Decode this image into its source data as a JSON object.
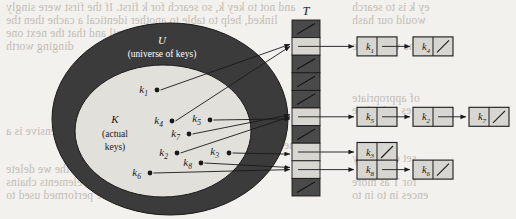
{
  "figure": {
    "table_label": "T",
    "universe_label": "U",
    "universe_sub": "(universe of keys)",
    "actual_label": "K",
    "actual_sub_line1": "(actual",
    "actual_sub_line2": "keys)",
    "colors": {
      "page_background": "#f3f1ed",
      "universe_ring": "#3b3b3b",
      "actual_set_fill": "#e2e0db",
      "slot_dark": "#4a4a4a",
      "slot_light": "#d8d6d1",
      "node_fill": "#d8d6d1",
      "stroke": "#1a1a1a",
      "ring_text": "#ffffff",
      "bleed_text": "#b9b4ac"
    }
  },
  "keys": [
    {
      "id": "k1",
      "label": "k",
      "sub": "1",
      "x": 148,
      "y": 93,
      "dot_x": 157,
      "dot_y": 90
    },
    {
      "id": "k4",
      "label": "k",
      "sub": "4",
      "x": 163,
      "y": 124,
      "dot_x": 172,
      "dot_y": 121
    },
    {
      "id": "k5",
      "label": "k",
      "sub": "5",
      "x": 201,
      "y": 122,
      "dot_x": 210,
      "dot_y": 120
    },
    {
      "id": "k7",
      "label": "k",
      "sub": "7",
      "x": 180,
      "y": 137,
      "dot_x": 189,
      "dot_y": 134
    },
    {
      "id": "k2",
      "label": "k",
      "sub": "2",
      "x": 168,
      "y": 156,
      "dot_x": 177,
      "dot_y": 153
    },
    {
      "id": "k3",
      "label": "k",
      "sub": "3",
      "x": 219,
      "y": 155,
      "dot_x": 229,
      "dot_y": 153
    },
    {
      "id": "k8",
      "label": "k",
      "sub": "8",
      "x": 192,
      "y": 166,
      "dot_x": 201,
      "dot_y": 163
    },
    {
      "id": "k6",
      "label": "k",
      "sub": "6",
      "x": 141,
      "y": 176,
      "dot_x": 150,
      "dot_y": 173
    }
  ],
  "table": {
    "x": 292,
    "y": 20,
    "width": 28,
    "slot_height": 17.6,
    "slots": [
      {
        "index": 0,
        "state": "nil"
      },
      {
        "index": 1,
        "state": "occupied"
      },
      {
        "index": 2,
        "state": "nil"
      },
      {
        "index": 3,
        "state": "nil"
      },
      {
        "index": 4,
        "state": "nil"
      },
      {
        "index": 5,
        "state": "occupied"
      },
      {
        "index": 6,
        "state": "nil"
      },
      {
        "index": 7,
        "state": "occupied"
      },
      {
        "index": 8,
        "state": "occupied"
      },
      {
        "index": 9,
        "state": "nil"
      }
    ]
  },
  "chains": [
    {
      "slot": 1,
      "nodes": [
        {
          "label": "k",
          "sub": "1",
          "next": "pointer"
        },
        {
          "label": "k",
          "sub": "4",
          "next": "nil"
        }
      ]
    },
    {
      "slot": 5,
      "nodes": [
        {
          "label": "k",
          "sub": "5",
          "next": "pointer"
        },
        {
          "label": "k",
          "sub": "2",
          "next": "pointer"
        },
        {
          "label": "k",
          "sub": "7",
          "next": "nil"
        }
      ]
    },
    {
      "slot": 7,
      "nodes": [
        {
          "label": "k",
          "sub": "3",
          "next": "nil"
        }
      ]
    },
    {
      "slot": 8,
      "nodes": [
        {
          "label": "k",
          "sub": "8",
          "next": "pointer"
        },
        {
          "label": "k",
          "sub": "6",
          "next": "nil"
        }
      ]
    }
  ],
  "hash_arrows": [
    {
      "from": "k1",
      "to_slot": 1
    },
    {
      "from": "k4",
      "to_slot": 1
    },
    {
      "from": "k5",
      "to_slot": 5
    },
    {
      "from": "k7",
      "to_slot": 5
    },
    {
      "from": "k2",
      "to_slot": 5
    },
    {
      "from": "k3",
      "to_slot": 7
    },
    {
      "from": "k8",
      "to_slot": 8
    },
    {
      "from": "k6",
      "to_slot": 8
    }
  ],
  "bleed_text": [
    {
      "text": "and not to key k, so search for k first. If the first were singly",
      "x": 6,
      "y": 1
    },
    {
      "text": "linked, help to table to another identical a cache then the",
      "x": 6,
      "y": 14
    },
    {
      "text": "e if it is a nil and that the next one",
      "x": 6,
      "y": 27
    },
    {
      "text": "dinging worth",
      "x": 6,
      "y": 40
    },
    {
      "text": "the many",
      "x": 232,
      "y": 104
    },
    {
      "text": "How expensive is a",
      "x": 6,
      "y": 125
    },
    {
      "text": "the dictionary",
      "x": 232,
      "y": 139
    },
    {
      "text": "a line, the the we delete",
      "x": 6,
      "y": 163
    },
    {
      "text": "the average number of elements chains",
      "x": 6,
      "y": 176
    },
    {
      "text": "of n, which can be performed used to",
      "x": 6,
      "y": 189
    },
    {
      "text": "ey k is to search",
      "x": 352,
      "y": 1
    },
    {
      "text": "would our hash",
      "x": 352,
      "y": 14
    },
    {
      "text": "in the within the",
      "x": 352,
      "y": 40
    },
    {
      "text": "of appropriate",
      "x": 352,
      "y": 92
    },
    {
      "text": "es in in time",
      "x": 352,
      "y": 104
    },
    {
      "text": "set of a many",
      "x": 352,
      "y": 152
    },
    {
      "text": "for T as more",
      "x": 352,
      "y": 176
    },
    {
      "text": "ences in to in to",
      "x": 352,
      "y": 189
    }
  ]
}
